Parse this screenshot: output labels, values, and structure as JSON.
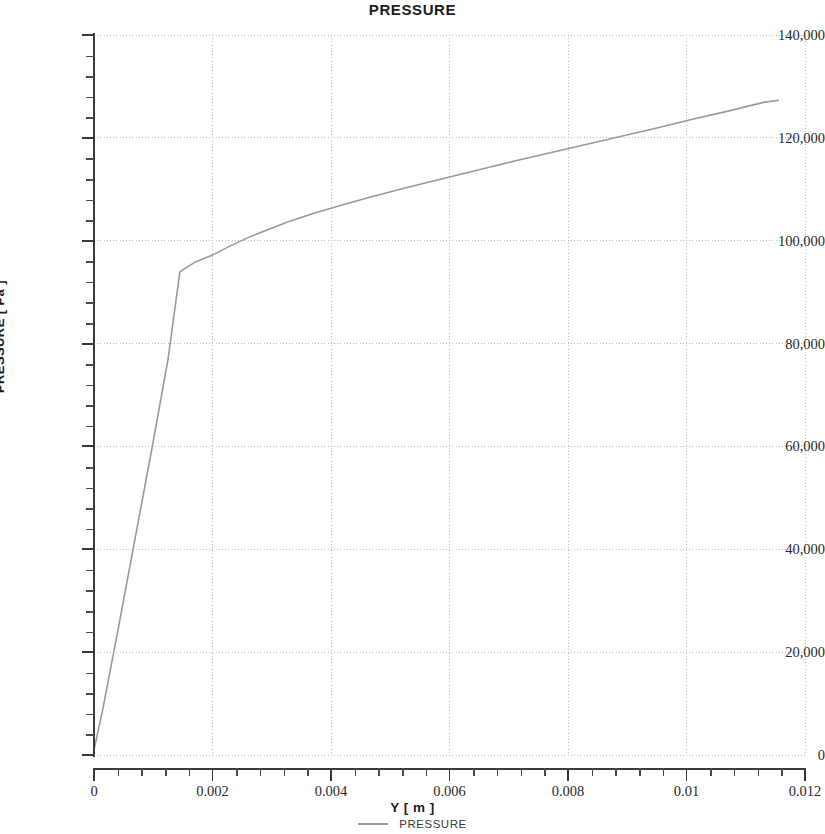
{
  "chart_data": {
    "type": "line",
    "title": "PRESSURE",
    "xlabel": "Y [ m ]",
    "ylabel": "PRESSURE [ Pa ]",
    "xlim": [
      0,
      0.012
    ],
    "ylim": [
      0,
      140000
    ],
    "grid": true,
    "legend_position": "bottom",
    "x_ticks": [
      0,
      0.002,
      0.004,
      0.006,
      0.008,
      0.01,
      0.012
    ],
    "x_tick_labels": [
      "0",
      "0.002",
      "0.004",
      "0.006",
      "0.008",
      "0.01",
      "0.012"
    ],
    "x_minor_per_major": 5,
    "y_ticks": [
      0,
      20000,
      40000,
      60000,
      80000,
      100000,
      120000,
      140000
    ],
    "y_tick_labels": [
      "0",
      "20,000",
      "40,000",
      "60,000",
      "80,000",
      "100,000",
      "120,000",
      "140,000"
    ],
    "y_minor_per_major": 4,
    "line_color": "#9a9a9a",
    "grid_color": "#bbbbbb",
    "axis_color": "#3a3a3a",
    "series": [
      {
        "name": "PRESSURE",
        "x": [
          0.0,
          0.00015,
          0.0004,
          0.0007,
          0.001,
          0.00125,
          0.00145,
          0.0017,
          0.002,
          0.0023,
          0.0026,
          0.0029,
          0.0033,
          0.0037,
          0.0042,
          0.0047,
          0.0053,
          0.0059,
          0.0065,
          0.0071,
          0.0077,
          0.0083,
          0.0089,
          0.0095,
          0.0101,
          0.0107,
          0.0113,
          0.01155
        ],
        "y": [
          1000,
          9000,
          24000,
          42500,
          61000,
          77000,
          94000,
          95800,
          97200,
          99000,
          100600,
          102000,
          103800,
          105300,
          107000,
          108600,
          110400,
          112100,
          113800,
          115500,
          117100,
          118700,
          120300,
          121900,
          123600,
          125200,
          126900,
          127300
        ]
      }
    ]
  },
  "legend": {
    "entries": [
      {
        "label": "PRESSURE",
        "color": "#9a9a9a",
        "marker": "line-swatch"
      }
    ]
  }
}
